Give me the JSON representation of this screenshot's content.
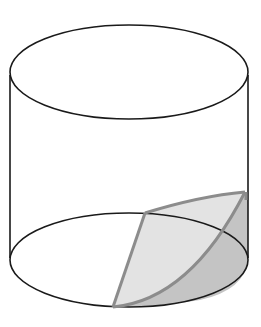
{
  "diagram": {
    "colors": {
      "outline": "#1a1a1a",
      "wedge_edge": "#8c8c8c",
      "cut_face_fill": "#e3e3e3",
      "lateral_face_fill": "#c4c4c4",
      "background": "#ffffff"
    },
    "labels": []
  }
}
